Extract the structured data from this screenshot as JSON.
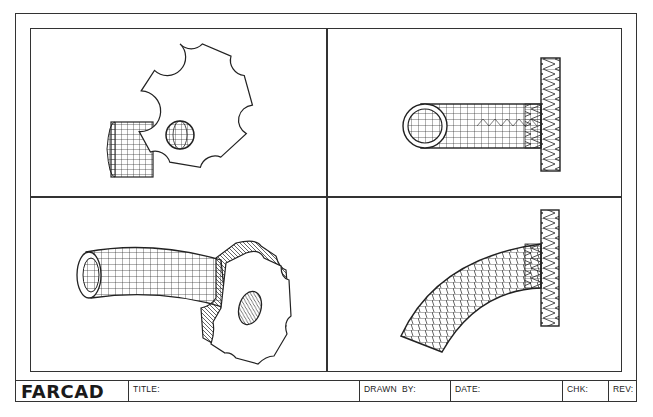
{
  "drawing": {
    "type": "CAD drawing sheet with four viewports",
    "viewports": [
      {
        "position": "top-left",
        "view": "front view",
        "subject": "sprocket flange with cylindrical tube behind"
      },
      {
        "position": "top-right",
        "view": "side/top view",
        "subject": "straight tube with flange (wireframe)"
      },
      {
        "position": "bottom-left",
        "view": "isometric view",
        "subject": "curved tube joined to sprocket flange"
      },
      {
        "position": "bottom-right",
        "view": "side view",
        "subject": "curved tube joined to flange (wireframe)"
      }
    ],
    "line_color": "#222222",
    "background_color": "#ffffff"
  },
  "title_block": {
    "logo": "FARCAD",
    "title_label": "TITLE:",
    "drawn_by_label": "DRAWN  BY:",
    "date_label": "DATE:",
    "chk_label": "CHK:",
    "rev_label": "REV:"
  }
}
